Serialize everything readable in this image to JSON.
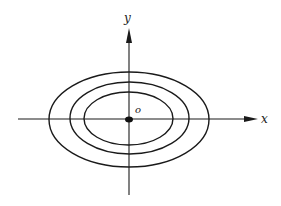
{
  "diagram": {
    "type": "level-curves",
    "colors": {
      "stroke": "#1a1a1a",
      "background": "#ffffff"
    },
    "axes": {
      "x_label": "x",
      "y_label": "y",
      "origin_label": "o"
    },
    "origin": {
      "cx": 129,
      "cy": 119
    },
    "ellipses": [
      {
        "name": "outer",
        "rx": 80,
        "ry": 47.5
      },
      {
        "name": "middle",
        "rx": 60,
        "ry": 36
      },
      {
        "name": "inner",
        "rx": 44.5,
        "ry": 26.5
      }
    ]
  }
}
